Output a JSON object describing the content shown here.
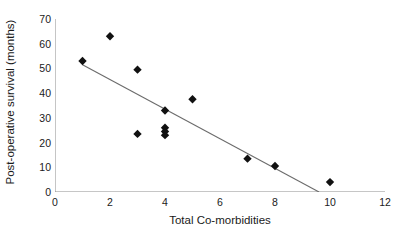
{
  "chart_data": {
    "type": "scatter",
    "title": "",
    "xlabel": "Total Co-morbidities",
    "ylabel": "Post-operative survival (months)",
    "xlim": [
      0,
      12
    ],
    "ylim": [
      0,
      70
    ],
    "xticks": [
      0,
      2,
      4,
      6,
      8,
      10,
      12
    ],
    "yticks": [
      0,
      10,
      20,
      30,
      40,
      50,
      60,
      70
    ],
    "xtick_labels": [
      "0",
      "2",
      "4",
      "6",
      "8",
      "10",
      "12"
    ],
    "ytick_labels": [
      "0",
      "10",
      "20",
      "30",
      "40",
      "50",
      "60",
      "70"
    ],
    "grid": false,
    "legend": null,
    "marker": "diamond",
    "marker_color": "#111111",
    "points": [
      {
        "x": 1,
        "y": 53
      },
      {
        "x": 2,
        "y": 63
      },
      {
        "x": 3,
        "y": 49.5
      },
      {
        "x": 3,
        "y": 23.5
      },
      {
        "x": 4,
        "y": 33
      },
      {
        "x": 4,
        "y": 26
      },
      {
        "x": 4,
        "y": 24.5
      },
      {
        "x": 4,
        "y": 23
      },
      {
        "x": 5,
        "y": 37.5
      },
      {
        "x": 7,
        "y": 13.5
      },
      {
        "x": 8,
        "y": 10.5
      },
      {
        "x": 10,
        "y": 4
      }
    ],
    "trendline": {
      "type": "linear",
      "color": "#6b6b6b",
      "x_start": 1,
      "y_start": 51.5,
      "x_end": 9.6,
      "y_end": 0
    },
    "axis_color": "#8c8c8c",
    "background": "#ffffff"
  }
}
